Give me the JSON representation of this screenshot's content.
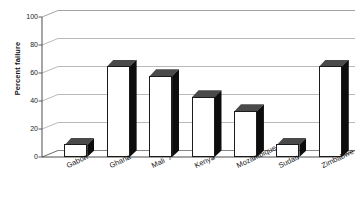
{
  "chart_data": {
    "type": "bar",
    "title": "",
    "xlabel": "",
    "ylabel": "Percent failure",
    "categories": [
      "Gabon",
      "Ghana",
      "Mali",
      "Kenya",
      "Mozambique",
      "Sudan",
      "Zimbabwe"
    ],
    "values": [
      9,
      65,
      58,
      43,
      33,
      9,
      65
    ],
    "ylim": [
      0,
      100
    ],
    "yticks": [
      0,
      20,
      40,
      60,
      80,
      100
    ],
    "ytick_labels": [
      "0",
      "20",
      "40",
      "60",
      "80",
      "100"
    ],
    "grid": true,
    "legend": false,
    "style": "3d-column",
    "colors": {
      "bar_front": "#ffffff",
      "bar_side": "#0d0d0d",
      "bar_top": "#4a4a4a",
      "bar_outline": "#1b1b1b",
      "gridline": "#a8a8a8",
      "axis": "#4d4d4d",
      "text": "#1a1a1a",
      "background": "#ffffff"
    }
  }
}
